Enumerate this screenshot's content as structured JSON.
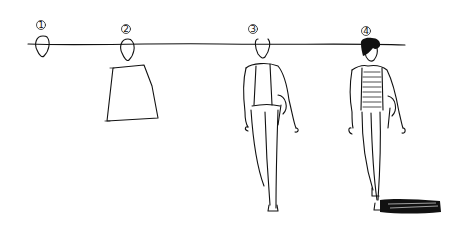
{
  "drawing": {
    "description": "Hand sketch showing four progressive stages of drawing a walking figure along a horizon line",
    "stages": [
      {
        "label": "1",
        "content": "head oval"
      },
      {
        "label": "2",
        "content": "head and torso block"
      },
      {
        "label": "3",
        "content": "outline figure walking"
      },
      {
        "label": "4",
        "content": "detailed figure with dark hair, striped shirt, jacket and cast shadow"
      }
    ],
    "ink_color": "#111111",
    "paper_color": "#ffffff"
  }
}
